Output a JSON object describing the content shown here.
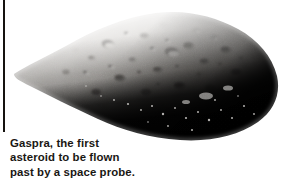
{
  "figure": {
    "background_color": "#ffffff",
    "border_color": "#15120f"
  },
  "image": {
    "lit_surface_color": "#e8e6e3",
    "midtone_color": "#8d8984",
    "shadow_color": "#0d0b09",
    "terminator_color": "#2a2724",
    "crater_highlight_color": "#f2f1ef"
  },
  "caption": {
    "lines": [
      "Gaspra, the first",
      "asteroid to be flown",
      "past by a space probe."
    ],
    "line_1": "Gaspra, the first",
    "line_2": "asteroid to be flown",
    "line_3": "past by a space probe.",
    "text_color": "#1a1713"
  }
}
